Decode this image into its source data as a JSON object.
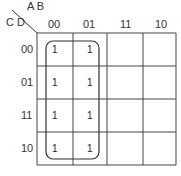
{
  "kmap": {
    "row_var_label": "C D",
    "col_var_label": "A B",
    "columns": [
      "00",
      "01",
      "11",
      "10"
    ],
    "rows": [
      "00",
      "01",
      "11",
      "10"
    ],
    "cells": [
      [
        "1",
        "1",
        "",
        ""
      ],
      [
        "1",
        "1",
        "",
        ""
      ],
      [
        "1",
        "1",
        "",
        ""
      ],
      [
        "1",
        "1",
        "",
        ""
      ]
    ],
    "groups": [
      {
        "name": "A'",
        "rows": [
          0,
          1,
          2,
          3
        ],
        "cols": [
          0,
          1
        ]
      }
    ]
  }
}
